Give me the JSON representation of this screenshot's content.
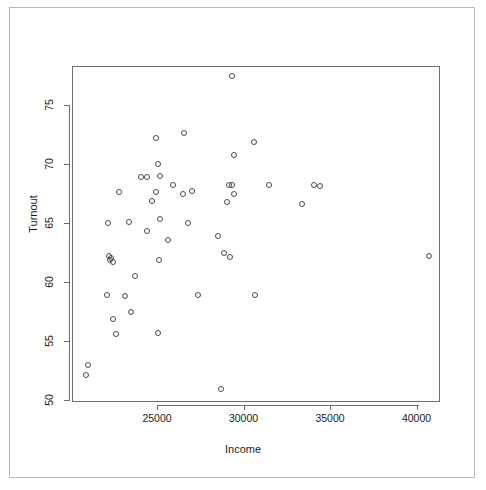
{
  "figure": {
    "background_color": "#ffffff",
    "frame_color": "#b9b9b9",
    "axis_color": "#6e6e6e",
    "point_color": "#4a4a4a"
  },
  "chart_data": {
    "type": "scatter",
    "title": "",
    "xlabel": "Income",
    "ylabel": "Turnout",
    "xlim": [
      20650,
      41750
    ],
    "ylim": [
      50.0,
      78.5
    ],
    "xticks": [
      25000,
      30000,
      35000,
      40000
    ],
    "xtick_labels": [
      "25000",
      "30000",
      "35000",
      "40000"
    ],
    "yticks": [
      50,
      55,
      60,
      65,
      70,
      75
    ],
    "ytick_labels": [
      "50",
      "55",
      "60",
      "65",
      "70",
      "75"
    ],
    "grid": false,
    "legend": null,
    "marker": "open-circle",
    "n_points": 50,
    "points": [
      {
        "x": 29350,
        "y": 77.5
      },
      {
        "x": 24950,
        "y": 72.2
      },
      {
        "x": 26550,
        "y": 72.6
      },
      {
        "x": 30600,
        "y": 71.9
      },
      {
        "x": 29450,
        "y": 70.8
      },
      {
        "x": 25050,
        "y": 70.0
      },
      {
        "x": 24400,
        "y": 68.9
      },
      {
        "x": 25150,
        "y": 69.0
      },
      {
        "x": 22800,
        "y": 67.6
      },
      {
        "x": 24950,
        "y": 67.6
      },
      {
        "x": 25900,
        "y": 68.2
      },
      {
        "x": 26500,
        "y": 67.5
      },
      {
        "x": 27000,
        "y": 67.7
      },
      {
        "x": 29350,
        "y": 68.2
      },
      {
        "x": 29450,
        "y": 67.5
      },
      {
        "x": 29050,
        "y": 66.8
      },
      {
        "x": 31500,
        "y": 68.2
      },
      {
        "x": 34100,
        "y": 68.2
      },
      {
        "x": 34450,
        "y": 68.1
      },
      {
        "x": 33400,
        "y": 66.6
      },
      {
        "x": 24700,
        "y": 66.9
      },
      {
        "x": 22150,
        "y": 65.0
      },
      {
        "x": 23400,
        "y": 65.1
      },
      {
        "x": 25200,
        "y": 65.3
      },
      {
        "x": 26800,
        "y": 65.0
      },
      {
        "x": 24400,
        "y": 64.3
      },
      {
        "x": 28500,
        "y": 63.9
      },
      {
        "x": 25650,
        "y": 63.6
      },
      {
        "x": 22250,
        "y": 62.2
      },
      {
        "x": 22300,
        "y": 61.9
      },
      {
        "x": 22450,
        "y": 61.7
      },
      {
        "x": 25100,
        "y": 61.9
      },
      {
        "x": 28900,
        "y": 62.5
      },
      {
        "x": 29200,
        "y": 62.1
      },
      {
        "x": 40750,
        "y": 62.2
      },
      {
        "x": 23750,
        "y": 60.5
      },
      {
        "x": 22100,
        "y": 58.9
      },
      {
        "x": 23150,
        "y": 58.8
      },
      {
        "x": 27350,
        "y": 58.9
      },
      {
        "x": 30650,
        "y": 58.9
      },
      {
        "x": 23500,
        "y": 57.5
      },
      {
        "x": 22450,
        "y": 56.9
      },
      {
        "x": 22650,
        "y": 55.6
      },
      {
        "x": 25050,
        "y": 55.7
      },
      {
        "x": 21000,
        "y": 53.0
      },
      {
        "x": 20900,
        "y": 52.1
      },
      {
        "x": 28700,
        "y": 50.9
      },
      {
        "x": 22350,
        "y": 62.0
      },
      {
        "x": 24100,
        "y": 68.9
      },
      {
        "x": 29150,
        "y": 68.2
      }
    ]
  }
}
